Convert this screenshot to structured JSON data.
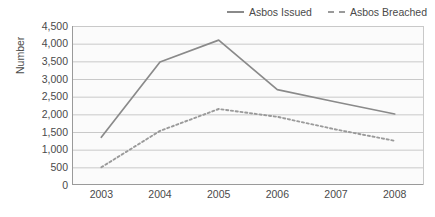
{
  "chart_data": {
    "type": "line",
    "title": "",
    "xlabel": "",
    "ylabel": "Number",
    "categories": [
      "2003",
      "2004",
      "2005",
      "2006",
      "2007",
      "2008"
    ],
    "x": [
      2003,
      2004,
      2005,
      2006,
      2007,
      2008
    ],
    "series": [
      {
        "name": "Asbos Issued",
        "style": "solid",
        "color": "#8a8a8a",
        "values": [
          1350,
          3480,
          4100,
          2700,
          2350,
          2010
        ]
      },
      {
        "name": "Asbos Breached",
        "style": "dashed",
        "color": "#9a9a9a",
        "values": [
          500,
          1530,
          2150,
          1930,
          1570,
          1250
        ]
      }
    ],
    "ylim": [
      0,
      4500
    ],
    "ytick_step": 500,
    "yticks": [
      0,
      500,
      1000,
      1500,
      2000,
      2500,
      3000,
      3500,
      4000,
      4500
    ],
    "ytick_labels": [
      "0",
      "500",
      "1,000",
      "1,500",
      "2,000",
      "2,500",
      "3,000",
      "3,500",
      "4,000",
      "4,500"
    ],
    "grid": "horizontal",
    "legend_position": "top-right",
    "plot_background": "#fbfbfb",
    "gridline_color": "#c9c9c9",
    "axis_color": "#9a9a9a"
  },
  "legend": {
    "entries": [
      {
        "label": "Asbos Issued",
        "style": "solid"
      },
      {
        "label": "Asbos Breached",
        "style": "dashed"
      }
    ]
  }
}
